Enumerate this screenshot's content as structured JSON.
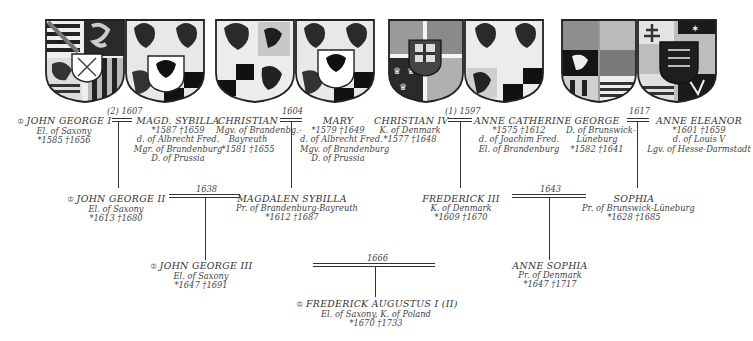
{
  "crown_icon": "♔",
  "generation1": [
    {
      "marriage": "(2) 1607",
      "husband": {
        "name": "JOHN GEORGE I",
        "crowned": true,
        "lines": [
          "El. of Saxony",
          "*1585   †1656"
        ]
      },
      "wife": {
        "name": "MAGD. SYBILLA",
        "lines": [
          "*1587   †1659",
          "d. of Albrecht Fred.",
          "Mgr. of Brandenburg",
          "D. of Prussia"
        ]
      }
    },
    {
      "marriage": "1604",
      "husband": {
        "name": "CHRISTIAN",
        "lines": [
          "Mgv. of Brandenbg.-",
          "Bayreuth",
          "*1581   †1655"
        ]
      },
      "wife": {
        "name": "MARY",
        "lines": [
          "*1579   †1649",
          "d. of Albrecht Fred.",
          "Mgv. of Brandenburg",
          "D. of Prussia"
        ]
      }
    },
    {
      "marriage": "(1) 1597",
      "husband": {
        "name": "CHRISTIAN IV",
        "lines": [
          "K. of Denmark",
          "*1577   †1648"
        ]
      },
      "wife": {
        "name": "ANNE CATHERINE",
        "lines": [
          "*1575   †1612",
          "d. of Joachim Fred.",
          "El. of Brandenburg"
        ]
      }
    },
    {
      "marriage": "1617",
      "husband": {
        "name": "GEORGE",
        "lines": [
          "D. of Brunswick-",
          "Lüneburg",
          "*1582   †1641"
        ]
      },
      "wife": {
        "name": "ANNE ELEANOR",
        "lines": [
          "*1601   †1659",
          "d. of Louis V",
          "Lgv. of Hesse-Darmstadt"
        ]
      }
    }
  ],
  "generation2": [
    {
      "marriage": "1638",
      "husband": {
        "name": "JOHN GEORGE II",
        "crowned": true,
        "lines": [
          "El. of Saxony",
          "*1613   †1680"
        ]
      },
      "wife": {
        "name": "MAGDALEN SYBILLA",
        "lines": [
          "Pr. of Brandenburg-Bayreuth",
          "*1612   †1687"
        ]
      }
    },
    {
      "marriage": "1643",
      "husband": {
        "name": "FREDERICK III",
        "lines": [
          "K. of Denmark",
          "*1609   †1670"
        ]
      },
      "wife": {
        "name": "SOPHIA",
        "lines": [
          "Pr. of Brunswick-Lüneburg",
          "*1628   †1685"
        ]
      }
    }
  ],
  "generation3": [
    {
      "marriage": "1666",
      "husband": {
        "name": "JOHN GEORGE III",
        "crowned": true,
        "lines": [
          "El. of Saxony",
          "*1647   †1691"
        ]
      },
      "wife": {
        "name": "ANNE SOPHIA",
        "lines": [
          "Pr. of Denmark",
          "*1647   †1717"
        ]
      }
    }
  ],
  "generation4": [
    {
      "name": "FREDERICK AUGUSTUS I (II)",
      "crowned": true,
      "lines": [
        "El. of Saxony, K. of Poland",
        "*1670   †1733"
      ]
    }
  ],
  "shields": [
    {
      "pair": "saxony-brandenburg",
      "colors": {
        "dark": "#1c1c1c",
        "mid": "#8a8a8a",
        "light": "#f2f2f2"
      }
    },
    {
      "pair": "brandenburg-bayreuth-brandenburg"
    },
    {
      "pair": "denmark-brandenburg"
    },
    {
      "pair": "brunswick-hesse"
    }
  ]
}
